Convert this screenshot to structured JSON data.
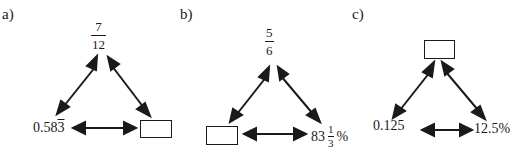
{
  "diagram": {
    "colors": {
      "ink": "#1a1a1a",
      "background": "#ffffff"
    },
    "panels": [
      {
        "label": "a)",
        "top": {
          "type": "fraction",
          "numerator": "7",
          "denominator": "12"
        },
        "bottom_left": {
          "type": "decimal",
          "value": "0.58",
          "repeating_digit": "3"
        },
        "bottom_right": {
          "type": "answer-box",
          "value": ""
        }
      },
      {
        "label": "b)",
        "top": {
          "type": "fraction",
          "numerator": "5",
          "denominator": "6"
        },
        "bottom_left": {
          "type": "answer-box",
          "value": ""
        },
        "bottom_right": {
          "type": "percent",
          "whole": "83",
          "numerator": "1",
          "denominator": "3",
          "suffix": "%"
        }
      },
      {
        "label": "c)",
        "top": {
          "type": "answer-box",
          "value": ""
        },
        "bottom_left": {
          "type": "decimal",
          "value": "0.125"
        },
        "bottom_right": {
          "type": "percent",
          "value": "12.5%"
        }
      }
    ]
  }
}
